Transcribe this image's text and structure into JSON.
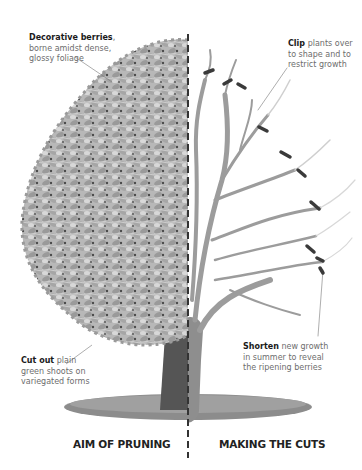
{
  "diagram": {
    "colors": {
      "background": "#ffffff",
      "foliage_light": "#c2c2c2",
      "foliage_mid": "#9a9a9a",
      "foliage_dark": "#4a4a4a",
      "trunk_left": "#555555",
      "trunk_right": "#8e8e8e",
      "branches": "#9c9c9c",
      "cut_marks": "#3a3a3a",
      "ground": "#8a8a8a",
      "divider": "#333333",
      "label_bold": "#1a1a1a",
      "label_text": "#6d6d6d"
    },
    "annotations": [
      {
        "id": "decorative-berries",
        "bold": "Decorative berries",
        "text_1": ",",
        "line_2": "borne amidst dense,",
        "line_3": "glossy foliage"
      },
      {
        "id": "clip",
        "bold": "Clip",
        "text_1": " plants over",
        "line_2": "to shape and to",
        "line_3": "restrict growth"
      },
      {
        "id": "cut-out",
        "bold": "Cut out",
        "text_1": " plain",
        "line_2": "green shoots on",
        "line_3": "variegated forms"
      },
      {
        "id": "shorten",
        "bold": "Shorten",
        "text_1": " new growth",
        "line_2": "in summer to reveal",
        "line_3": "the ripening berries"
      }
    ],
    "captions": {
      "left": "AIM OF PRUNING",
      "right": "MAKING THE CUTS"
    },
    "icons": {
      "divider": "dashed-vertical-line",
      "cut_mark": "short-dark-bar"
    }
  }
}
